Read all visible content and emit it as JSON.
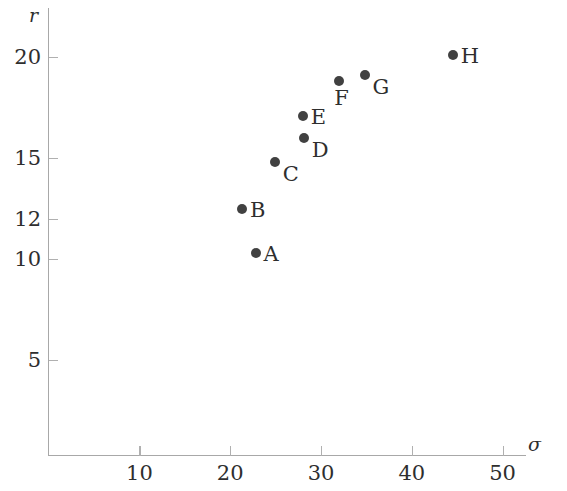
{
  "chart_data": {
    "type": "scatter",
    "title": "",
    "xlabel": "σ",
    "ylabel": "r",
    "xlim": [
      0,
      54
    ],
    "ylim": [
      0,
      22.2
    ],
    "grid": false,
    "legend": "none",
    "xticks": [
      10,
      20,
      30,
      40,
      50
    ],
    "xtick_labels": [
      "10",
      "20",
      "30",
      "40",
      "50"
    ],
    "yticks": [
      5,
      10,
      12,
      15,
      20
    ],
    "ytick_labels": [
      "5",
      "10",
      "12",
      "15",
      "20"
    ],
    "point_labels": [
      "A",
      "B",
      "C",
      "D",
      "E",
      "F",
      "G",
      "H"
    ],
    "x": [
      22.8,
      21.3,
      24.9,
      28.1,
      28.0,
      32.0,
      34.8,
      44.5
    ],
    "y": [
      10.3,
      12.5,
      14.8,
      16.0,
      17.1,
      18.8,
      19.1,
      20.1
    ],
    "points": [
      {
        "label": "A",
        "x": 22.8,
        "y": 10.3,
        "label_pos": "right"
      },
      {
        "label": "B",
        "x": 21.3,
        "y": 12.5,
        "label_pos": "right"
      },
      {
        "label": "C",
        "x": 24.9,
        "y": 14.8,
        "label_pos": "below-right"
      },
      {
        "label": "D",
        "x": 28.1,
        "y": 16.0,
        "label_pos": "below-right"
      },
      {
        "label": "E",
        "x": 28.0,
        "y": 17.1,
        "label_pos": "right"
      },
      {
        "label": "F",
        "x": 32.0,
        "y": 18.8,
        "label_pos": "below-left"
      },
      {
        "label": "G",
        "x": 34.8,
        "y": 19.1,
        "label_pos": "below-right"
      },
      {
        "label": "H",
        "x": 44.5,
        "y": 20.1,
        "label_pos": "right"
      }
    ],
    "colors": {
      "marker": "#414141",
      "axis": "#a8a8a8",
      "text": "#2e2e2e",
      "background": "#ffffff"
    }
  }
}
